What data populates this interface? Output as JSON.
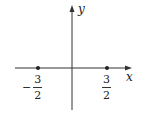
{
  "diagram": {
    "type": "number-line-on-axes",
    "axes": {
      "x_label": "x",
      "y_label": "y"
    },
    "points": [
      {
        "name": "left-point",
        "value": "-3/2",
        "sign": "−",
        "numerator": "3",
        "denominator": "2"
      },
      {
        "name": "right-point",
        "value": "3/2",
        "sign": "",
        "numerator": "3",
        "denominator": "2"
      }
    ],
    "colors": {
      "axis": "#333333",
      "point": "#222222"
    }
  }
}
